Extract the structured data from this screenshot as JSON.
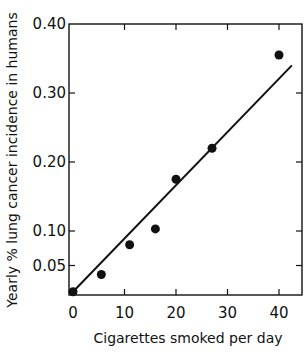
{
  "chart_data": {
    "type": "scatter",
    "title": "",
    "xlabel": "Cigarettes smoked per day",
    "ylabel": "Yearly % lung cancer incidence in humans",
    "xlim": [
      -1,
      44
    ],
    "ylim": [
      0.007,
      0.4
    ],
    "x_ticks": [
      0,
      10,
      20,
      30,
      40
    ],
    "x_tick_labels": [
      "0",
      "10",
      "20",
      "30",
      "40"
    ],
    "y_ticks": [
      0.05,
      0.1,
      0.2,
      0.3,
      0.4
    ],
    "y_tick_labels": [
      "0.05",
      "0.10",
      "0.20",
      "0.30",
      "0.40"
    ],
    "grid": false,
    "legend": null,
    "series": [
      {
        "name": "observed",
        "kind": "scatter",
        "x": [
          0,
          5.5,
          11,
          16,
          20,
          27,
          40
        ],
        "y": [
          0.012,
          0.037,
          0.08,
          0.103,
          0.175,
          0.22,
          0.355
        ]
      },
      {
        "name": "fit",
        "kind": "line",
        "x": [
          0,
          42.5
        ],
        "y": [
          0.012,
          0.34
        ]
      }
    ]
  },
  "colors": {
    "ink": "#111111",
    "background": "#ffffff"
  }
}
